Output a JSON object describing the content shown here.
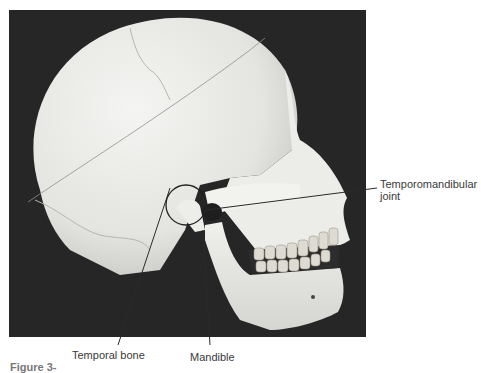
{
  "figure": {
    "labels": {
      "tmj_line1": "Temporomandibular",
      "tmj_line2": "joint",
      "temporal_bone": "Temporal bone",
      "mandible": "Mandible"
    },
    "caption_fragment": "Figure 3-",
    "colors": {
      "background": "#262626",
      "bone": "#e9e9e6",
      "label_text": "#3a3a3a",
      "leader_line": "#2a2a2a"
    }
  }
}
